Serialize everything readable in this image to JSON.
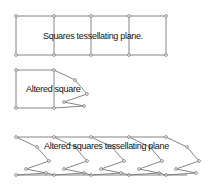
{
  "labels": {
    "top": "Squares tessellating plane.",
    "middle": "Altered square",
    "bottom": "Altered squares tessellating plane"
  },
  "colors": {
    "line": "#777777",
    "node": "#666666",
    "text": "#111111"
  },
  "top_grid": {
    "xs": [
      16,
      54,
      91,
      129,
      166
    ],
    "y_top": 16,
    "y_bottom": 55
  },
  "altered_square": {
    "square": {
      "x1": 16,
      "y1": 70,
      "x2": 54,
      "y2": 108
    },
    "zigzag": [
      [
        54,
        70
      ],
      [
        75,
        80
      ],
      [
        87,
        94
      ],
      [
        64,
        102
      ],
      [
        84,
        106
      ],
      [
        54,
        108
      ]
    ]
  },
  "bottom_tiling": {
    "xs": [
      16,
      54,
      91,
      129,
      166
    ],
    "y_top": 137,
    "y_bottom": 175,
    "zigzag_offsets": [
      [
        0,
        0
      ],
      [
        21,
        10
      ],
      [
        33,
        24
      ],
      [
        10,
        32
      ],
      [
        30,
        36
      ],
      [
        0,
        38
      ]
    ]
  }
}
